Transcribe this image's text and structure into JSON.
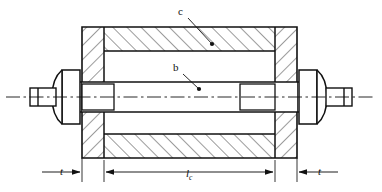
{
  "figure": {
    "type": "engineering-cross-section",
    "background_color": "#ffffff",
    "line_color": "#111111"
  },
  "callouts": [
    {
      "id": "c",
      "label": "c",
      "target": "upper-tube-wall-section",
      "label_x": 178,
      "label_y": 6,
      "leader_from_x": 188,
      "leader_from_y": 18,
      "leader_to_x": 212,
      "leader_to_y": 44
    },
    {
      "id": "b",
      "label": "b",
      "target": "central-bolt-shank",
      "label_x": 173,
      "label_y": 62,
      "leader_from_x": 183,
      "leader_from_y": 74,
      "leader_to_x": 199,
      "leader_to_y": 89
    }
  ],
  "dimensions": [
    {
      "id": "t-left",
      "label": "t",
      "label_html": "t",
      "subscript": "",
      "italic": true,
      "arrow_direction": "right",
      "line_start_x": 42,
      "line_end_x": 82,
      "line_y": 172,
      "extension_x": 82
    },
    {
      "id": "lc",
      "label": "lc",
      "label_html": "l",
      "subscript": "c",
      "italic": true,
      "arrow_direction": "both",
      "line_start_x": 104,
      "line_end_x": 275,
      "line_y": 172,
      "extension_left_x": 104,
      "extension_right_x": 275
    },
    {
      "id": "t-right",
      "label": "t",
      "label_html": "t",
      "subscript": "",
      "italic": true,
      "arrow_direction": "left",
      "line_start_x": 297,
      "line_end_x": 338,
      "line_y": 172,
      "extension_x": 297
    }
  ],
  "geometry": {
    "centerline_y": 97,
    "centerline_x_start": 6,
    "centerline_x_end": 376,
    "body_left_x": 82,
    "body_right_x": 297,
    "body_top_y": 27,
    "body_bottom_y": 158,
    "flange_left_inner_x": 104,
    "flange_right_inner_x": 275,
    "tube_wall_inner_top_y": 51,
    "tube_wall_inner_bottom_y": 134,
    "bolt_top_y": 82,
    "bolt_bottom_y": 112,
    "hatch_spacing": 10,
    "hatch_angle_deg": 45
  }
}
